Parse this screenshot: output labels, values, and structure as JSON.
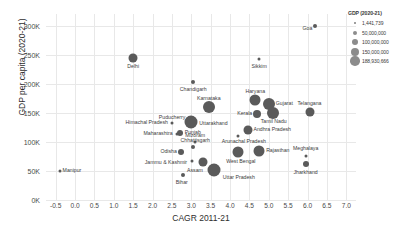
{
  "chart_data": {
    "type": "scatter",
    "title": "",
    "xlabel": "CAGR 2011-21",
    "ylabel": "GDP per capita (2020-21)",
    "xlim": [
      -0.75,
      7.25
    ],
    "ylim": [
      0,
      320000
    ],
    "grid": true,
    "size_encodes": "GDP (2020-21)",
    "x_ticks": [
      "-0.5",
      "0.0",
      "0.5",
      "1.0",
      "1.5",
      "2.0",
      "2.5",
      "3.0",
      "3.5",
      "4.0",
      "4.5",
      "5.0",
      "5.5",
      "6.0",
      "6.5",
      "7.0"
    ],
    "x_tick_values": [
      -0.5,
      0.0,
      0.5,
      1.0,
      1.5,
      2.0,
      2.5,
      3.0,
      3.5,
      4.0,
      4.5,
      5.0,
      5.5,
      6.0,
      6.5,
      7.0
    ],
    "y_ticks": [
      "0K",
      "50K",
      "100K",
      "150K",
      "200K",
      "250K",
      "300K"
    ],
    "y_tick_values": [
      0,
      50000,
      100000,
      150000,
      200000,
      250000,
      300000
    ],
    "points": [
      {
        "label": "Goa",
        "x": 6.2,
        "y": 300000,
        "size": 4,
        "anchor": "end",
        "dx": -3,
        "dy": 3
      },
      {
        "label": "Delhi",
        "x": 1.5,
        "y": 245000,
        "size": 9,
        "anchor": "mid",
        "dx": 0,
        "dy": 9
      },
      {
        "label": "Sikkim",
        "x": 4.75,
        "y": 243000,
        "size": 3,
        "anchor": "mid",
        "dx": 0,
        "dy": 8
      },
      {
        "label": "Chandigarh",
        "x": 3.05,
        "y": 203000,
        "size": 4,
        "anchor": "mid",
        "dx": 0,
        "dy": 8
      },
      {
        "label": "Haryana",
        "x": 4.65,
        "y": 172000,
        "size": 11,
        "anchor": "mid",
        "dx": 0,
        "dy": -8
      },
      {
        "label": "Karnataka",
        "x": 3.45,
        "y": 160000,
        "size": 12,
        "anchor": "mid",
        "dx": 0,
        "dy": -8
      },
      {
        "label": "Gujarat",
        "x": 5.0,
        "y": 165000,
        "size": 12,
        "anchor": "start",
        "dx": 7,
        "dy": 0
      },
      {
        "label": "Telangana",
        "x": 6.05,
        "y": 152000,
        "size": 9,
        "anchor": "mid",
        "dx": 0,
        "dy": -8
      },
      {
        "label": "Kerala",
        "x": 4.7,
        "y": 148000,
        "size": 8,
        "anchor": "end",
        "dx": -5,
        "dy": 0
      },
      {
        "label": "Tamil Nadu",
        "x": 5.1,
        "y": 150000,
        "size": 12,
        "anchor": "mid",
        "dx": 1,
        "dy": 9
      },
      {
        "label": "Puducherry",
        "x": 2.95,
        "y": 141000,
        "size": 3,
        "anchor": "end",
        "dx": -4,
        "dy": 0
      },
      {
        "label": "Uttarakhand",
        "x": 3.0,
        "y": 135000,
        "size": 13,
        "anchor": "start",
        "dx": 8,
        "dy": 2
      },
      {
        "label": "Himachal Pradesh",
        "x": 2.5,
        "y": 133000,
        "size": 3,
        "anchor": "end",
        "dx": -4,
        "dy": 0
      },
      {
        "label": "Andhra Pradesh",
        "x": 4.45,
        "y": 120000,
        "size": 9,
        "anchor": "start",
        "dx": 6,
        "dy": 0
      },
      {
        "label": "Punjab",
        "x": 2.7,
        "y": 115000,
        "size": 6,
        "anchor": "start",
        "dx": 5,
        "dy": 0
      },
      {
        "label": "Maharashtra",
        "x": 2.62,
        "y": 114000,
        "size": 3,
        "anchor": "end",
        "dx": -4,
        "dy": 0
      },
      {
        "label": "Arunachal Pradesh",
        "x": 4.2,
        "y": 110000,
        "size": 3,
        "anchor": "mid",
        "dx": 6,
        "dy": 6
      },
      {
        "label": "Mizoram",
        "x": 3.1,
        "y": 100000,
        "size": 3,
        "anchor": "mid",
        "dx": 0,
        "dy": -6
      },
      {
        "label": "Chhattisgarh",
        "x": 3.05,
        "y": 92000,
        "size": 4,
        "anchor": "mid",
        "dx": 2,
        "dy": -6
      },
      {
        "label": "Rajasthan",
        "x": 4.75,
        "y": 85000,
        "size": 11,
        "anchor": "start",
        "dx": 7,
        "dy": 0
      },
      {
        "label": "West Bengal",
        "x": 4.2,
        "y": 83000,
        "size": 11,
        "anchor": "mid",
        "dx": 3,
        "dy": 10
      },
      {
        "label": "Odisha",
        "x": 2.73,
        "y": 83000,
        "size": 6,
        "anchor": "end",
        "dx": -4,
        "dy": 0
      },
      {
        "label": "Meghalaya",
        "x": 5.95,
        "y": 75000,
        "size": 3,
        "anchor": "mid",
        "dx": 0,
        "dy": -7
      },
      {
        "label": "Jammu & Kashmir",
        "x": 3.02,
        "y": 67000,
        "size": 3,
        "anchor": "end",
        "dx": -5,
        "dy": 2
      },
      {
        "label": "Assam",
        "x": 3.3,
        "y": 66000,
        "size": 9,
        "anchor": "mid",
        "dx": -8,
        "dy": 9
      },
      {
        "label": "Jharkhand",
        "x": 5.95,
        "y": 62000,
        "size": 6,
        "anchor": "mid",
        "dx": 0,
        "dy": 9
      },
      {
        "label": "Manipur",
        "x": -0.4,
        "y": 50000,
        "size": 3,
        "anchor": "start",
        "dx": 3,
        "dy": 0
      },
      {
        "label": "Uttar Pradesh",
        "x": 3.58,
        "y": 52000,
        "size": 13,
        "anchor": "start",
        "dx": 9,
        "dy": 8
      },
      {
        "label": "Bihar",
        "x": 2.78,
        "y": 43000,
        "size": 4,
        "anchor": "mid",
        "dx": -1,
        "dy": 8
      }
    ],
    "legend": {
      "title": "GDP (2020-21)",
      "position": "top-right",
      "entries": [
        {
          "value": "1,441,739",
          "size": 1.6
        },
        {
          "value": "50,000,000",
          "size": 4.4
        },
        {
          "value": "100,000,000",
          "size": 6.4
        },
        {
          "value": "150,000,000",
          "size": 8.2
        },
        {
          "value": "188,930,666",
          "size": 9.6
        }
      ]
    }
  }
}
